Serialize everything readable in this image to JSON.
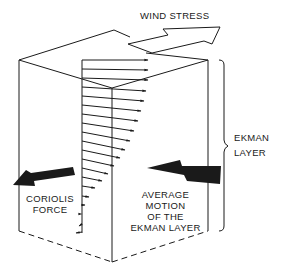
{
  "diagram": {
    "labels": {
      "wind_stress": "WIND STRESS",
      "ekman_layer_line1": "EKMAN",
      "ekman_layer_line2": "LAYER",
      "coriolis_line1": "CORIOLIS",
      "coriolis_line2": "FORCE",
      "average_line1": "AVERAGE",
      "average_line2": "MOTION",
      "average_line3": "OF THE",
      "average_line4": "EKMAN LAYER"
    },
    "colors": {
      "ink": "#1a1a1a",
      "background": "#ffffff"
    },
    "velocity_profile": {
      "origin_x": 82,
      "arrows": [
        {
          "y": 60,
          "tip_x": 148,
          "tip_y": 60
        },
        {
          "y": 69,
          "tip_x": 148,
          "tip_y": 70
        },
        {
          "y": 78,
          "tip_x": 148,
          "tip_y": 80
        },
        {
          "y": 87,
          "tip_x": 146,
          "tip_y": 91
        },
        {
          "y": 96,
          "tip_x": 144,
          "tip_y": 101
        },
        {
          "y": 105,
          "tip_x": 141,
          "tip_y": 111
        },
        {
          "y": 114,
          "tip_x": 138,
          "tip_y": 121
        },
        {
          "y": 123,
          "tip_x": 134,
          "tip_y": 131
        },
        {
          "y": 132,
          "tip_x": 130,
          "tip_y": 141
        },
        {
          "y": 141,
          "tip_x": 125,
          "tip_y": 150
        },
        {
          "y": 150,
          "tip_x": 120,
          "tip_y": 158
        },
        {
          "y": 159,
          "tip_x": 114,
          "tip_y": 166
        },
        {
          "y": 168,
          "tip_x": 108,
          "tip_y": 174
        },
        {
          "y": 177,
          "tip_x": 102,
          "tip_y": 181
        },
        {
          "y": 186,
          "tip_x": 95,
          "tip_y": 188
        },
        {
          "y": 196,
          "tip_x": 89,
          "tip_y": 197
        },
        {
          "y": 205,
          "tip_x": 85,
          "tip_y": 205
        },
        {
          "y": 214,
          "tip_x": 82,
          "tip_y": 214
        },
        {
          "y": 224,
          "tip_x": 79,
          "tip_y": 226
        },
        {
          "y": 232,
          "tip_x": 76,
          "tip_y": 233
        }
      ]
    }
  }
}
